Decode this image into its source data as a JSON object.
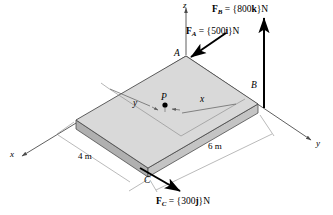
{
  "figure": {
    "colors": {
      "plate_top": "#d9d9d9",
      "plate_front": "#c4c4c4",
      "plate_side": "#b0b0b0",
      "outline": "#4d4d4d",
      "dim_line": "#8c8c8c",
      "arrow": "#000000",
      "axis": "#4d4d4d"
    },
    "axes": [
      {
        "name": "x-axis",
        "label": "x"
      },
      {
        "name": "y-axis",
        "label": "y"
      },
      {
        "name": "z-axis",
        "label": "z"
      }
    ],
    "points": [
      {
        "name": "point-a",
        "label": "A"
      },
      {
        "name": "point-b",
        "label": "B"
      },
      {
        "name": "point-c",
        "label": "C"
      },
      {
        "name": "point-p",
        "label": "P"
      }
    ],
    "dimensions": [
      {
        "name": "plate-width",
        "label": "4 m"
      },
      {
        "name": "plate-length",
        "label": "6 m"
      },
      {
        "name": "distance-x",
        "label": "x"
      },
      {
        "name": "distance-y",
        "label": "y"
      }
    ],
    "forces": [
      {
        "name": "force-a",
        "symbol": "F",
        "subscript": "A",
        "equals": " = {",
        "magnitude": "500",
        "direction": "i",
        "close": "}N",
        "value": 500,
        "unit": "N",
        "component": "i"
      },
      {
        "name": "force-b",
        "symbol": "F",
        "subscript": "B",
        "equals": " = {",
        "magnitude": "800",
        "direction": "k",
        "close": "}N",
        "value": 800,
        "unit": "N",
        "component": "k"
      },
      {
        "name": "force-c",
        "symbol": "F",
        "subscript": "C",
        "equals": " = {",
        "magnitude": "300",
        "direction": "j",
        "close": "}N",
        "value": 300,
        "unit": "N",
        "component": "j"
      }
    ]
  }
}
